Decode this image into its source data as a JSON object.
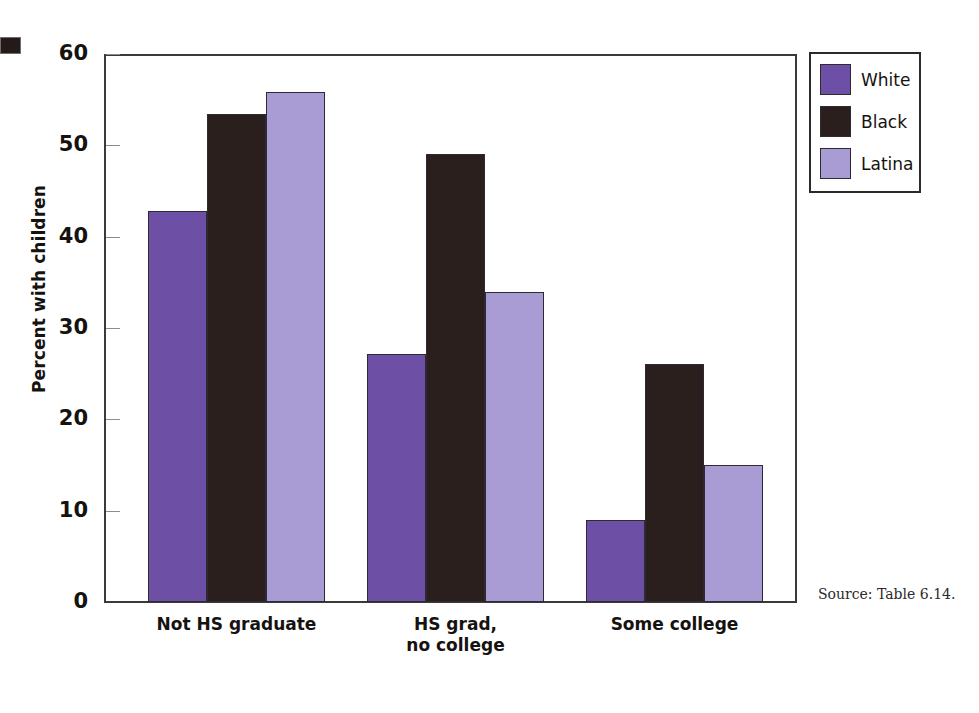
{
  "figure": {
    "edge_mark": "black-square-mark"
  },
  "chart_data": {
    "type": "bar",
    "title": "",
    "subtitle": "",
    "xlabel": "",
    "ylabel": "Percent with children",
    "ylim": [
      0,
      60
    ],
    "yticks": [
      0,
      10,
      20,
      30,
      40,
      50,
      60
    ],
    "ytick_labels": [
      "0",
      "10",
      "20",
      "30",
      "40",
      "50",
      "60"
    ],
    "grid": false,
    "legend_position": "right-top",
    "categories": [
      "Not HS graduate",
      "HS grad,\nno college",
      "Some college"
    ],
    "series": [
      {
        "name": "White",
        "color": "#6d50a5",
        "values": [
          42.8,
          27.2,
          9.0
        ]
      },
      {
        "name": "Black",
        "color": "#2a1f1c",
        "values": [
          53.4,
          49.1,
          26.1
        ]
      },
      {
        "name": "Latina",
        "color": "#a99bd4",
        "values": [
          55.8,
          33.9,
          15.0
        ]
      }
    ],
    "source_note": "Source: Table 6.14."
  }
}
